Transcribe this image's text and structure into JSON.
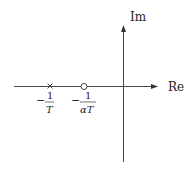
{
  "diagram": {
    "type": "pole-zero-plot",
    "axes": {
      "real_label": "Re",
      "imag_label": "Im"
    },
    "pole": {
      "marker": "×",
      "label_minus": "−",
      "label_num": "1",
      "label_den": "T"
    },
    "zero": {
      "marker": "○",
      "label_minus": "−",
      "label_num": "1",
      "label_den": "αT"
    },
    "colors": {
      "line": "#333333",
      "text": "#222222"
    }
  }
}
